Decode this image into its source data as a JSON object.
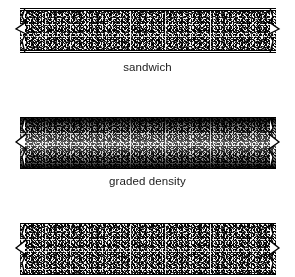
{
  "figure": {
    "background_color": "#ffffff",
    "line_color": "#000000",
    "text_color": "#1b1b1b",
    "width_px": 295,
    "height_px": 277
  },
  "panels": [
    {
      "id": "sandwich",
      "caption": "sandwich",
      "fill": "uniform-speckle",
      "description": "uniform stippled core between two thin white face sheets",
      "has_face_sheets": true,
      "has_break_symbols": true,
      "bar": {
        "left_px": 20,
        "top_px": 8,
        "width_px": 256,
        "height_px": 45
      },
      "caption_y_px": 60
    },
    {
      "id": "graded-density",
      "caption": "graded density",
      "fill": "graded-speckle",
      "description": "stippled bar, dark at upper and lower surfaces, light through mid-thickness",
      "has_face_sheets": false,
      "has_break_symbols": true,
      "bar": {
        "left_px": 20,
        "top_px": 117,
        "width_px": 256,
        "height_px": 52
      },
      "caption_y_px": 174
    },
    {
      "id": "uniform-third",
      "caption": "",
      "fill": "uniform-speckle",
      "description": "uniform stippled bar, cropped by the lower image edge",
      "has_face_sheets": false,
      "has_break_symbols": true,
      "bar": {
        "left_px": 20,
        "top_px": 223,
        "width_px": 256,
        "height_px": 52
      },
      "caption_y_px": null
    }
  ],
  "icons": {
    "break_symbol": "break-line-symbol"
  }
}
